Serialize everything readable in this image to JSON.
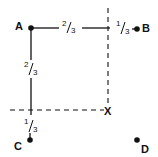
{
  "diagram": {
    "points": [
      {
        "id": "A",
        "label": "A",
        "x": 31,
        "y": 28,
        "lx": 15,
        "ly": 30
      },
      {
        "id": "B",
        "label": "B",
        "x": 137,
        "y": 29,
        "lx": 142,
        "ly": 31
      },
      {
        "id": "C",
        "label": "C",
        "x": 30,
        "y": 140,
        "lx": 14,
        "ly": 150
      },
      {
        "id": "D",
        "label": "D",
        "x": 137,
        "y": 140,
        "lx": 141,
        "ly": 153
      }
    ],
    "intersection": {
      "label": "X",
      "x": 108,
      "y": 110
    },
    "fractions": {
      "ab_major": {
        "num": "2",
        "den": "3"
      },
      "ab_minor": {
        "num": "1",
        "den": "3"
      },
      "ac_major": {
        "num": "2",
        "den": "3"
      },
      "ac_minor": {
        "num": "1",
        "den": "3"
      }
    },
    "colors": {
      "ink": "#111111",
      "background": "#ffffff"
    }
  }
}
